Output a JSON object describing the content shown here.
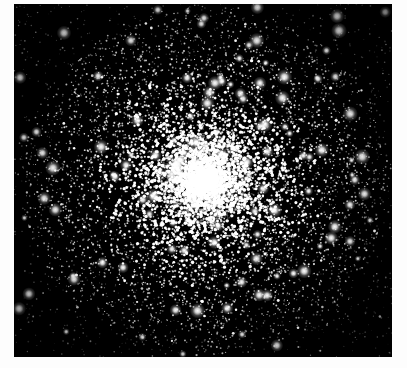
{
  "figure": {
    "image_type": "astronomical-photograph",
    "color_mode": "grayscale",
    "background_color": "#000000",
    "page_margin_color": "#ffffff",
    "star_color": "#ffffff",
    "core_color": "#ffffff"
  },
  "plate": {
    "left": 14,
    "top": 4,
    "width": 378,
    "height": 353
  },
  "cluster": {
    "center_x": 191,
    "center_y": 176,
    "core_radius": 17,
    "bright_core_radius": 46,
    "halo_radius": 178,
    "total_star_count": 9000,
    "brightest_star_count": 140,
    "concentration": "high",
    "shape": "slightly-elliptical"
  },
  "render": {
    "seed": 20240517,
    "density_falloff": 1.55,
    "field_star_fraction": 0.2
  }
}
